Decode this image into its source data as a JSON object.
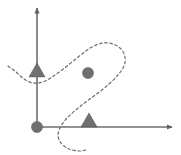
{
  "figure": {
    "title": "",
    "width": 181,
    "height": 155,
    "background_color": "#ffffff",
    "axis_color": "#6e6e6e",
    "curve_color": "#6e6e6e",
    "marker_color": "#707070",
    "marker_stroke_color": "#5a5a5a"
  },
  "chart_data": {
    "type": "scatter",
    "title": "",
    "xlabel": "",
    "ylabel": "",
    "xlim": [
      0,
      181
    ],
    "ylim": [
      0,
      155
    ],
    "grid": false,
    "legend": null,
    "axes": {
      "origin": [
        37,
        127
      ],
      "x_axis": {
        "from": [
          37,
          127
        ],
        "to": [
          172,
          127
        ],
        "arrow": "right",
        "label": ""
      },
      "y_axis": {
        "from": [
          37,
          127
        ],
        "to": [
          37,
          8
        ],
        "arrow": "up",
        "label": ""
      }
    },
    "markers": [
      {
        "shape": "circle",
        "x": 37,
        "y": 127,
        "size": 11,
        "label": ""
      },
      {
        "shape": "triangle",
        "x": 37,
        "y": 70,
        "size": 16,
        "label": ""
      },
      {
        "shape": "circle",
        "x": 88,
        "y": 73,
        "size": 11,
        "label": ""
      },
      {
        "shape": "triangle",
        "x": 89,
        "y": 120,
        "size": 16,
        "label": ""
      }
    ],
    "series": [
      {
        "name": "dashed-curve",
        "style": "dashed",
        "closed": false,
        "points": [
          [
            8,
            66
          ],
          [
            16,
            72
          ],
          [
            24,
            79
          ],
          [
            33,
            83
          ],
          [
            43,
            82
          ],
          [
            52,
            77
          ],
          [
            62,
            70
          ],
          [
            72,
            62
          ],
          [
            82,
            54
          ],
          [
            92,
            47
          ],
          [
            103,
            43
          ],
          [
            113,
            44
          ],
          [
            121,
            49
          ],
          [
            125,
            57
          ],
          [
            124,
            66
          ],
          [
            118,
            75
          ],
          [
            109,
            84
          ],
          [
            98,
            93
          ],
          [
            87,
            101
          ],
          [
            77,
            109
          ],
          [
            68,
            117
          ],
          [
            61,
            126
          ],
          [
            58,
            135
          ],
          [
            61,
            143
          ],
          [
            69,
            149
          ],
          [
            79,
            151
          ],
          [
            86,
            150
          ]
        ]
      }
    ]
  }
}
